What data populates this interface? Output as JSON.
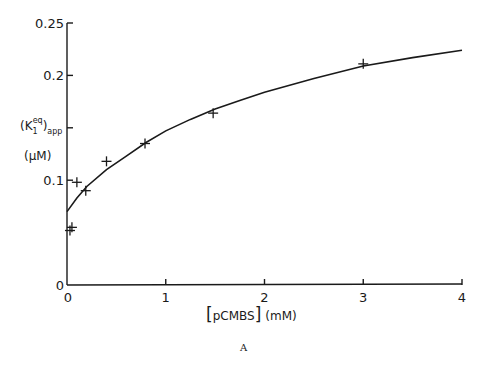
{
  "chart_data": {
    "type": "scatter",
    "title": "",
    "panel_label": "A",
    "xlabel": "[pCMBS] (mM)",
    "xlabel_parts": {
      "bracket_left": "[",
      "name": "pCMBS",
      "bracket_right": "]",
      "unit": "(mM)"
    },
    "ylabel": "(K1eq)app (μM)",
    "ylabel_parts": {
      "open": "(K",
      "sub": "1",
      "sup": "eq",
      "close": ")",
      "sub2": "app",
      "unit": "(μM)"
    },
    "xlim": [
      0,
      4
    ],
    "ylim": [
      0,
      0.25
    ],
    "x_ticks": [
      0,
      1,
      2,
      3,
      4
    ],
    "x_tick_labels": [
      "0",
      "1",
      "2",
      "3",
      "4"
    ],
    "y_ticks": [
      0,
      0.1,
      0.15,
      0.2,
      0.25
    ],
    "y_tick_labels": [
      "0",
      "0.1",
      "",
      "0.2",
      "0.25"
    ],
    "grid": false,
    "legend": null,
    "series": [
      {
        "name": "measured",
        "marker": "+",
        "points": [
          {
            "x": 0.03,
            "y": 0.052
          },
          {
            "x": 0.05,
            "y": 0.055
          },
          {
            "x": 0.1,
            "y": 0.098
          },
          {
            "x": 0.19,
            "y": 0.09
          },
          {
            "x": 0.4,
            "y": 0.118
          },
          {
            "x": 0.79,
            "y": 0.135
          },
          {
            "x": 1.48,
            "y": 0.164
          },
          {
            "x": 3.0,
            "y": 0.211
          }
        ]
      },
      {
        "name": "fitted curve",
        "marker": "line",
        "points": [
          {
            "x": 0.0,
            "y": 0.07
          },
          {
            "x": 0.1,
            "y": 0.083
          },
          {
            "x": 0.2,
            "y": 0.094
          },
          {
            "x": 0.4,
            "y": 0.11
          },
          {
            "x": 0.6,
            "y": 0.123
          },
          {
            "x": 0.8,
            "y": 0.136
          },
          {
            "x": 1.0,
            "y": 0.147
          },
          {
            "x": 1.25,
            "y": 0.158
          },
          {
            "x": 1.5,
            "y": 0.168
          },
          {
            "x": 1.75,
            "y": 0.176
          },
          {
            "x": 2.0,
            "y": 0.184
          },
          {
            "x": 2.5,
            "y": 0.197
          },
          {
            "x": 3.0,
            "y": 0.209
          },
          {
            "x": 3.5,
            "y": 0.217
          },
          {
            "x": 4.0,
            "y": 0.224
          }
        ]
      }
    ]
  }
}
